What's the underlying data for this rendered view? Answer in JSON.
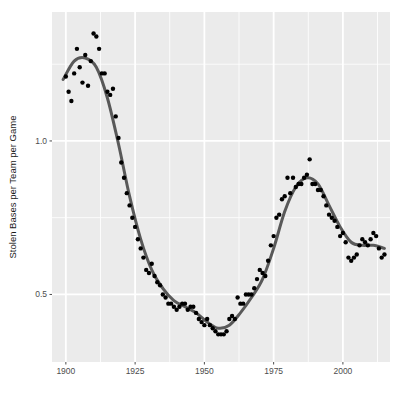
{
  "chart_data": {
    "type": "scatter",
    "title": "",
    "subtitle": "",
    "xlabel": "",
    "ylabel": "Stolen Bases per Team per Game",
    "xlim": [
      1895,
      2017
    ],
    "ylim": [
      0.28,
      1.42
    ],
    "xticks": [
      1900,
      1925,
      1950,
      1975,
      2000
    ],
    "xtick_labels": [
      "1900",
      "1925",
      "1950",
      "1975",
      "2000"
    ],
    "yticks": [
      0.5,
      1.0
    ],
    "ytick_labels": [
      "0.5",
      "1.0"
    ],
    "grid": true,
    "grid_color": "#ffffff",
    "panel_background": "#ebebeb",
    "legend": "none",
    "point_color": "#000000",
    "point_size": 2.2,
    "smooth_line_color": "#595959",
    "smooth_line_width": 3.0,
    "series": [
      {
        "name": "Stolen bases per team per game",
        "x": [
          1900,
          1901,
          1902,
          1903,
          1904,
          1905,
          1906,
          1907,
          1908,
          1909,
          1910,
          1911,
          1912,
          1913,
          1914,
          1915,
          1916,
          1917,
          1918,
          1919,
          1920,
          1921,
          1922,
          1923,
          1924,
          1925,
          1926,
          1927,
          1928,
          1929,
          1930,
          1931,
          1932,
          1933,
          1934,
          1935,
          1936,
          1937,
          1938,
          1939,
          1940,
          1941,
          1942,
          1943,
          1944,
          1945,
          1946,
          1947,
          1948,
          1949,
          1950,
          1951,
          1952,
          1953,
          1954,
          1955,
          1956,
          1957,
          1958,
          1959,
          1960,
          1961,
          1962,
          1963,
          1964,
          1965,
          1966,
          1967,
          1968,
          1969,
          1970,
          1971,
          1972,
          1973,
          1974,
          1975,
          1976,
          1977,
          1978,
          1979,
          1980,
          1981,
          1982,
          1983,
          1984,
          1985,
          1986,
          1987,
          1988,
          1989,
          1990,
          1991,
          1992,
          1993,
          1994,
          1995,
          1996,
          1997,
          1998,
          1999,
          2000,
          2001,
          2002,
          2003,
          2004,
          2005,
          2006,
          2007,
          2008,
          2009,
          2010,
          2011,
          2012,
          2013,
          2014,
          2015
        ],
        "y": [
          1.21,
          1.16,
          1.13,
          1.22,
          1.3,
          1.24,
          1.19,
          1.28,
          1.18,
          1.26,
          1.35,
          1.34,
          1.3,
          1.22,
          1.22,
          1.16,
          1.15,
          1.17,
          1.08,
          1.01,
          0.93,
          0.88,
          0.83,
          0.79,
          0.75,
          0.72,
          0.68,
          0.65,
          0.62,
          0.58,
          0.57,
          0.6,
          0.56,
          0.54,
          0.53,
          0.5,
          0.49,
          0.47,
          0.47,
          0.46,
          0.45,
          0.46,
          0.47,
          0.47,
          0.45,
          0.46,
          0.46,
          0.44,
          0.42,
          0.41,
          0.4,
          0.42,
          0.4,
          0.39,
          0.38,
          0.37,
          0.37,
          0.37,
          0.38,
          0.42,
          0.43,
          0.42,
          0.49,
          0.47,
          0.47,
          0.5,
          0.5,
          0.5,
          0.52,
          0.55,
          0.58,
          0.57,
          0.56,
          0.61,
          0.66,
          0.69,
          0.75,
          0.76,
          0.81,
          0.82,
          0.88,
          0.83,
          0.88,
          0.85,
          0.86,
          0.86,
          0.88,
          0.89,
          0.94,
          0.86,
          0.86,
          0.84,
          0.84,
          0.82,
          0.79,
          0.76,
          0.75,
          0.74,
          0.72,
          0.69,
          0.7,
          0.67,
          0.62,
          0.61,
          0.62,
          0.63,
          0.66,
          0.68,
          0.67,
          0.66,
          0.68,
          0.7,
          0.69,
          0.65,
          0.62,
          0.63
        ]
      }
    ],
    "smooth": {
      "method": "loess",
      "description": "LOESS smoothing curve: peak near 1911 (~1.27), steep decline through the 1920s-30s, trough near 1950 (~0.38), rise to a secondary peak near 1987 (~0.88), then decline to ~0.65 by 2015",
      "points_x": [
        1899,
        1903,
        1907,
        1911,
        1915,
        1919,
        1923,
        1927,
        1931,
        1935,
        1939,
        1943,
        1947,
        1951,
        1955,
        1959,
        1963,
        1967,
        1971,
        1975,
        1979,
        1983,
        1987,
        1991,
        1995,
        1999,
        2003,
        2007,
        2011,
        2015
      ],
      "points_y": [
        1.2,
        1.26,
        1.27,
        1.24,
        1.14,
        0.99,
        0.82,
        0.68,
        0.58,
        0.52,
        0.48,
        0.46,
        0.44,
        0.41,
        0.39,
        0.4,
        0.44,
        0.49,
        0.55,
        0.65,
        0.77,
        0.85,
        0.88,
        0.86,
        0.79,
        0.72,
        0.67,
        0.66,
        0.66,
        0.65
      ]
    }
  },
  "axes": {
    "y_title": "Stolen Bases per Team per Game",
    "x_title": "",
    "y_tick_0": "0.5",
    "y_tick_1": "1.0",
    "x_tick_0": "1900",
    "x_tick_1": "1925",
    "x_tick_2": "1950",
    "x_tick_3": "1975",
    "x_tick_4": "2000"
  },
  "colors": {
    "panel": "#ebebeb",
    "gridline": "#ffffff",
    "point": "#000000",
    "smooth": "#595959",
    "tick_text": "#4d4d4d",
    "title_text": "#1a1a1a",
    "page_background": "#ffffff"
  }
}
